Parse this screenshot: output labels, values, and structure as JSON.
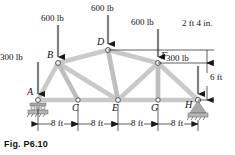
{
  "figure": {
    "caption": "Fig. P6.10",
    "joints": [
      {
        "id": "A",
        "label": "A",
        "x": 38,
        "y": 100,
        "support": "roller"
      },
      {
        "id": "B",
        "label": "B",
        "x": 58,
        "y": 63,
        "support": "none"
      },
      {
        "id": "C",
        "label": "C",
        "x": 78,
        "y": 100,
        "support": "none"
      },
      {
        "id": "D",
        "label": "D",
        "x": 108,
        "y": 50,
        "support": "none"
      },
      {
        "id": "E",
        "label": "E",
        "x": 118,
        "y": 100,
        "support": "none"
      },
      {
        "id": "F",
        "label": "F",
        "x": 158,
        "y": 63,
        "support": "none"
      },
      {
        "id": "G",
        "label": "G",
        "x": 158,
        "y": 100,
        "support": "none"
      },
      {
        "id": "H",
        "label": "H",
        "x": 198,
        "y": 100,
        "support": "pin"
      }
    ],
    "members": [
      {
        "from": "A",
        "to": "B"
      },
      {
        "from": "B",
        "to": "D"
      },
      {
        "from": "D",
        "to": "F"
      },
      {
        "from": "F",
        "to": "H"
      },
      {
        "from": "A",
        "to": "C"
      },
      {
        "from": "C",
        "to": "E"
      },
      {
        "from": "E",
        "to": "G"
      },
      {
        "from": "G",
        "to": "H"
      },
      {
        "from": "B",
        "to": "C"
      },
      {
        "from": "D",
        "to": "E"
      },
      {
        "from": "F",
        "to": "G"
      },
      {
        "from": "B",
        "to": "E"
      },
      {
        "from": "E",
        "to": "F"
      }
    ],
    "loads": [
      {
        "name": "load-at-A",
        "value": "300 lb",
        "text_x": 0,
        "text_y": 52,
        "arrow_x": 38,
        "arrow_top": 62,
        "arrow_bottom": 97
      },
      {
        "name": "load-at-B",
        "value": "600 lb",
        "text_x": 41,
        "text_y": 13,
        "arrow_x": 58,
        "arrow_top": 25,
        "arrow_bottom": 60
      },
      {
        "name": "load-at-D",
        "value": "600 lb",
        "text_x": 91,
        "text_y": 3,
        "arrow_x": 108,
        "arrow_top": 15,
        "arrow_bottom": 47
      },
      {
        "name": "load-at-F",
        "value": "600 lb",
        "text_x": 131,
        "text_y": 17,
        "arrow_x": 158,
        "arrow_top": 29,
        "arrow_bottom": 60
      },
      {
        "name": "load-at-H",
        "value": "300 lb",
        "text_x": 166,
        "text_y": 53,
        "arrow_x": 198,
        "arrow_top": 66,
        "arrow_bottom": 97
      }
    ],
    "dimensions": {
      "horizontal": [
        {
          "label": "8 ft",
          "x1": 38,
          "x2": 78
        },
        {
          "label": "8 ft",
          "x1": 78,
          "x2": 118
        },
        {
          "label": "8 ft",
          "x1": 118,
          "x2": 158
        },
        {
          "label": "8 ft",
          "x1": 158,
          "x2": 198
        }
      ],
      "vertical": [
        {
          "label": "2 ft 4 in.",
          "text_x": 186,
          "text_y": 18,
          "line_x": 207,
          "y1": 50,
          "y2": 63
        },
        {
          "label": "6 ft",
          "text_x": 210,
          "text_y": 72,
          "line_x": 207,
          "y1": 63,
          "y2": 100
        }
      ],
      "dim_line_y": 124,
      "extension_lines_from_y": 104,
      "extension_lines_to_y": 131
    },
    "colors": {
      "member_fill": "#c8c8c8",
      "member_edge": "#9a9a9a",
      "ink": "#1a1a1a",
      "support_fill": "#a8a8a8",
      "joint_fill": "#f2f2f2"
    }
  }
}
